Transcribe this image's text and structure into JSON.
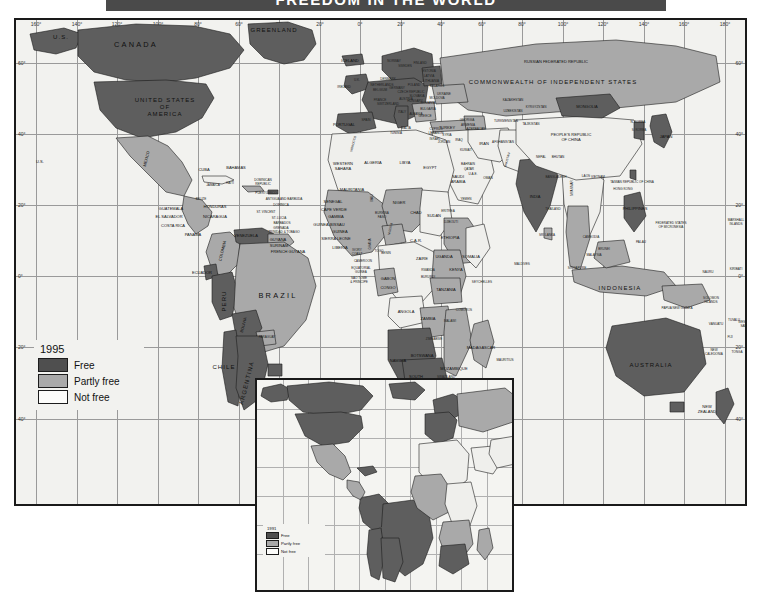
{
  "title": {
    "text": "FREEDOM IN THE WORLD",
    "band_color": "#4a4a4a"
  },
  "legend": {
    "year": "1995",
    "items": [
      {
        "label": "Free",
        "color": "#4f4f4f",
        "key": "free"
      },
      {
        "label": "Partly free",
        "color": "#a9a9a9",
        "key": "partly"
      },
      {
        "label": "Not free",
        "color": "#fcfcfa",
        "key": "notfree"
      }
    ]
  },
  "inset_legend": {
    "year": "1991",
    "items": [
      {
        "label": "Free",
        "color": "#4f4f4f",
        "key": "free"
      },
      {
        "label": "Partly free",
        "color": "#a9a9a9",
        "key": "partly"
      },
      {
        "label": "Not free",
        "color": "#fcfcfa",
        "key": "notfree"
      }
    ]
  },
  "graticule": {
    "longitude_labels": [
      "160°",
      "140°",
      "120°",
      "100°",
      "80°",
      "60°",
      "40°",
      "20°",
      "0°",
      "20°",
      "40°",
      "60°",
      "80°",
      "100°",
      "120°",
      "140°",
      "160°",
      "180°"
    ],
    "latitude_labels_left": [
      "60°",
      "40°",
      "20°",
      "0°",
      "20°",
      "40°"
    ],
    "latitude_labels_right": [
      "60°",
      "40°",
      "20°",
      "0°",
      "20°",
      "40°"
    ]
  },
  "map_labels": {
    "north_america": [
      {
        "t": "U.S.",
        "x": 45,
        "y": 17,
        "c": "md"
      },
      {
        "t": "CANADA",
        "x": 120,
        "y": 25,
        "c": "lg"
      },
      {
        "t": "UNITED STATES\nOF\nAMERICA",
        "x": 149,
        "y": 87,
        "c": "md"
      },
      {
        "t": "U.S.",
        "x": 24,
        "y": 142,
        "c": "sm"
      },
      {
        "t": "GREENLAND",
        "x": 258,
        "y": 10,
        "c": "md"
      },
      {
        "t": "MEXICO",
        "x": 131,
        "y": 139,
        "c": "sm",
        "r": "rot"
      }
    ],
    "central_america_caribbean": [
      {
        "t": "CUBA",
        "x": 188,
        "y": 150,
        "c": "sm"
      },
      {
        "t": "BAHAMAS",
        "x": 220,
        "y": 148,
        "c": "sm"
      },
      {
        "t": "JAMAICA",
        "x": 197,
        "y": 166,
        "c": "xs"
      },
      {
        "t": "HAITI",
        "x": 214,
        "y": 164,
        "c": "xs"
      },
      {
        "t": "DOMINICAN\nREPUBLIC",
        "x": 247,
        "y": 163,
        "c": "xs"
      },
      {
        "t": "PUERTO RICO",
        "x": 250,
        "y": 174,
        "c": "xs"
      },
      {
        "t": "BELIZE",
        "x": 185,
        "y": 180,
        "c": "xs"
      },
      {
        "t": "GUATEMALA",
        "x": 155,
        "y": 189,
        "c": "sm"
      },
      {
        "t": "HONDURAS",
        "x": 199,
        "y": 187,
        "c": "sm"
      },
      {
        "t": "EL SALVADOR",
        "x": 153,
        "y": 197,
        "c": "sm"
      },
      {
        "t": "NICARAGUA",
        "x": 199,
        "y": 197,
        "c": "sm"
      },
      {
        "t": "COSTA RICA",
        "x": 157,
        "y": 206,
        "c": "sm"
      },
      {
        "t": "PANAMA",
        "x": 177,
        "y": 215,
        "c": "sm"
      },
      {
        "t": "ANTIGUA AND BARBUDA",
        "x": 268,
        "y": 180,
        "c": "xs"
      },
      {
        "t": "DOMINICA",
        "x": 265,
        "y": 186,
        "c": "xs"
      },
      {
        "t": "ST. LUCIA",
        "x": 263,
        "y": 199,
        "c": "xs"
      },
      {
        "t": "ST. VINCENT",
        "x": 250,
        "y": 193,
        "c": "xs"
      },
      {
        "t": "BARBADOS",
        "x": 266,
        "y": 204,
        "c": "xs"
      },
      {
        "t": "GRENADA",
        "x": 265,
        "y": 209,
        "c": "xs"
      },
      {
        "t": "TRINIDAD & TOBAGO",
        "x": 268,
        "y": 213,
        "c": "xs"
      }
    ],
    "south_america": [
      {
        "t": "VENEZUELA",
        "x": 230,
        "y": 216,
        "c": "sm"
      },
      {
        "t": "COLOMBIA",
        "x": 207,
        "y": 231,
        "c": "sm",
        "r": "rot"
      },
      {
        "t": "GUYANA",
        "x": 262,
        "y": 220,
        "c": "sm"
      },
      {
        "t": "SURINAM",
        "x": 263,
        "y": 226,
        "c": "sm"
      },
      {
        "t": "FRENCH GUYANA",
        "x": 272,
        "y": 232,
        "c": "sm"
      },
      {
        "t": "ECUADOR",
        "x": 186,
        "y": 253,
        "c": "sm"
      },
      {
        "t": "PERU",
        "x": 208,
        "y": 281,
        "c": "md",
        "r": "rotv"
      },
      {
        "t": "BRAZIL",
        "x": 262,
        "y": 276,
        "c": "lg"
      },
      {
        "t": "BOLIVIA",
        "x": 228,
        "y": 305,
        "c": "sm",
        "r": "rot"
      },
      {
        "t": "CHILE",
        "x": 208,
        "y": 347,
        "c": "md"
      },
      {
        "t": "ARGENTINA",
        "x": 231,
        "y": 363,
        "c": "md",
        "r": "rot"
      },
      {
        "t": "URUGUAY",
        "x": 262,
        "y": 371,
        "c": "sm"
      },
      {
        "t": "PARAGUAY",
        "x": 251,
        "y": 318,
        "c": "xs"
      }
    ],
    "europe": [
      {
        "t": "ICELAND",
        "x": 334,
        "y": 41,
        "c": "sm"
      },
      {
        "t": "IRELAND",
        "x": 328,
        "y": 68,
        "c": "xs"
      },
      {
        "t": "U.K.",
        "x": 341,
        "y": 61,
        "c": "xs"
      },
      {
        "t": "NORWAY",
        "x": 378,
        "y": 42,
        "c": "xs"
      },
      {
        "t": "SWEDEN",
        "x": 389,
        "y": 47,
        "c": "xs"
      },
      {
        "t": "FINLAND",
        "x": 404,
        "y": 44,
        "c": "xs"
      },
      {
        "t": "DENMARK",
        "x": 372,
        "y": 60,
        "c": "xs"
      },
      {
        "t": "ESTONIA",
        "x": 413,
        "y": 52,
        "c": "xs"
      },
      {
        "t": "LATVIA",
        "x": 413,
        "y": 57,
        "c": "xs"
      },
      {
        "t": "LITHUANIA",
        "x": 415,
        "y": 62,
        "c": "xs"
      },
      {
        "t": "BELARUS",
        "x": 421,
        "y": 67,
        "c": "xs"
      },
      {
        "t": "POLAND",
        "x": 398,
        "y": 66,
        "c": "xs"
      },
      {
        "t": "GERMANY",
        "x": 381,
        "y": 69,
        "c": "xs"
      },
      {
        "t": "NETHERLANDS",
        "x": 366,
        "y": 66,
        "c": "xs"
      },
      {
        "t": "BELGIUM",
        "x": 364,
        "y": 71,
        "c": "xs"
      },
      {
        "t": "FRANCE",
        "x": 364,
        "y": 81,
        "c": "xs"
      },
      {
        "t": "SWITZERLAND",
        "x": 372,
        "y": 85,
        "c": "xs"
      },
      {
        "t": "AUSTRIA",
        "x": 390,
        "y": 80,
        "c": "xs"
      },
      {
        "t": "CZECH REPUBLIC",
        "x": 395,
        "y": 73,
        "c": "xs"
      },
      {
        "t": "SLOVAKIA",
        "x": 401,
        "y": 77,
        "c": "xs"
      },
      {
        "t": "HUNGARY",
        "x": 399,
        "y": 82,
        "c": "xs"
      },
      {
        "t": "ROMANIA",
        "x": 412,
        "y": 84,
        "c": "xs"
      },
      {
        "t": "UKRAINE",
        "x": 428,
        "y": 75,
        "c": "xs"
      },
      {
        "t": "MOLDOVA",
        "x": 421,
        "y": 79,
        "c": "xs"
      },
      {
        "t": "BULGARIA",
        "x": 412,
        "y": 90,
        "c": "xs"
      },
      {
        "t": "GREECE",
        "x": 409,
        "y": 97,
        "c": "xs"
      },
      {
        "t": "ALBANIA",
        "x": 400,
        "y": 95,
        "c": "xs"
      },
      {
        "t": "ITALY",
        "x": 386,
        "y": 93,
        "c": "xs"
      },
      {
        "t": "PORTUGAL",
        "x": 328,
        "y": 105,
        "c": "sm"
      },
      {
        "t": "SPAIN",
        "x": 350,
        "y": 101,
        "c": "xs"
      },
      {
        "t": "MALTA",
        "x": 390,
        "y": 109,
        "c": "xs"
      },
      {
        "t": "CYPRUS",
        "x": 420,
        "y": 110,
        "c": "xs"
      }
    ],
    "middle_east": [
      {
        "t": "TURKEY",
        "x": 431,
        "y": 108,
        "c": "sm"
      },
      {
        "t": "GEORGIA",
        "x": 451,
        "y": 101,
        "c": "xs"
      },
      {
        "t": "ARMENIA",
        "x": 452,
        "y": 106,
        "c": "xs"
      },
      {
        "t": "AZERBAIJAN",
        "x": 460,
        "y": 110,
        "c": "xs"
      },
      {
        "t": "SYRIA",
        "x": 431,
        "y": 116,
        "c": "xs"
      },
      {
        "t": "LEBANON",
        "x": 420,
        "y": 114,
        "c": "xs"
      },
      {
        "t": "ISRAEL",
        "x": 419,
        "y": 120,
        "c": "xs"
      },
      {
        "t": "JORDAN",
        "x": 428,
        "y": 123,
        "c": "xs"
      },
      {
        "t": "IRAQ",
        "x": 443,
        "y": 121,
        "c": "xs"
      },
      {
        "t": "IRAN",
        "x": 468,
        "y": 124,
        "c": "sm"
      },
      {
        "t": "KUWAIT",
        "x": 450,
        "y": 131,
        "c": "xs"
      },
      {
        "t": "BAHRAIN",
        "x": 452,
        "y": 145,
        "c": "xs"
      },
      {
        "t": "QATAR",
        "x": 453,
        "y": 150,
        "c": "xs"
      },
      {
        "t": "U.A.E.",
        "x": 457,
        "y": 155,
        "c": "xs"
      },
      {
        "t": "SAUDI\nARABIA",
        "x": 442,
        "y": 160,
        "c": "sm"
      },
      {
        "t": "OMAN",
        "x": 472,
        "y": 159,
        "c": "xs"
      },
      {
        "t": "YEMEN",
        "x": 450,
        "y": 180,
        "c": "xs"
      },
      {
        "t": "AFGHANISTAN",
        "x": 487,
        "y": 123,
        "c": "xs"
      },
      {
        "t": "PAKISTAN",
        "x": 492,
        "y": 140,
        "c": "xs",
        "r": "rot"
      }
    ],
    "africa": [
      {
        "t": "MOROCCO",
        "x": 338,
        "y": 124,
        "c": "xs",
        "r": "rot"
      },
      {
        "t": "ALGERIA",
        "x": 357,
        "y": 143,
        "c": "sm"
      },
      {
        "t": "TUNISIA",
        "x": 380,
        "y": 114,
        "c": "xs"
      },
      {
        "t": "LIBYA",
        "x": 389,
        "y": 143,
        "c": "sm"
      },
      {
        "t": "EGYPT",
        "x": 414,
        "y": 148,
        "c": "sm"
      },
      {
        "t": "WESTERN\nSAHARA",
        "x": 327,
        "y": 147,
        "c": "sm"
      },
      {
        "t": "MAURITANIA",
        "x": 336,
        "y": 170,
        "c": "sm"
      },
      {
        "t": "SENEGAL",
        "x": 317,
        "y": 182,
        "c": "sm"
      },
      {
        "t": "CAPE VERDE",
        "x": 318,
        "y": 190,
        "c": "sm"
      },
      {
        "t": "GAMBIA",
        "x": 320,
        "y": 197,
        "c": "sm"
      },
      {
        "t": "GUINEA-BISSAU",
        "x": 313,
        "y": 205,
        "c": "sm"
      },
      {
        "t": "GUINEA",
        "x": 324,
        "y": 212,
        "c": "sm"
      },
      {
        "t": "SIERRA LEONE",
        "x": 320,
        "y": 219,
        "c": "sm"
      },
      {
        "t": "LIBERIA",
        "x": 324,
        "y": 228,
        "c": "sm"
      },
      {
        "t": "MALI",
        "x": 357,
        "y": 178,
        "c": "xs",
        "r": "rotv"
      },
      {
        "t": "BURKINA\nFASO",
        "x": 366,
        "y": 196,
        "c": "xs"
      },
      {
        "t": "NIGER",
        "x": 383,
        "y": 183,
        "c": "sm"
      },
      {
        "t": "CHAD",
        "x": 400,
        "y": 193,
        "c": "sm"
      },
      {
        "t": "SUDAN",
        "x": 418,
        "y": 196,
        "c": "sm"
      },
      {
        "t": "NIGERIA",
        "x": 375,
        "y": 209,
        "c": "xs",
        "r": "rot"
      },
      {
        "t": "IVORY\nCOAST",
        "x": 341,
        "y": 233,
        "c": "xs"
      },
      {
        "t": "GHANA",
        "x": 355,
        "y": 224,
        "c": "xs",
        "r": "rotv"
      },
      {
        "t": "TOGO",
        "x": 363,
        "y": 232,
        "c": "xs"
      },
      {
        "t": "BENIN",
        "x": 370,
        "y": 234,
        "c": "xs"
      },
      {
        "t": "CAMEROON",
        "x": 347,
        "y": 242,
        "c": "xs"
      },
      {
        "t": "EQUATORIAL\nGUINEA",
        "x": 345,
        "y": 251,
        "c": "xs"
      },
      {
        "t": "SAO TOME\n& PRINCIPE",
        "x": 343,
        "y": 261,
        "c": "xs"
      },
      {
        "t": "GABON",
        "x": 372,
        "y": 259,
        "c": "sm"
      },
      {
        "t": "CONGO",
        "x": 372,
        "y": 268,
        "c": "sm"
      },
      {
        "t": "C.A.R.",
        "x": 400,
        "y": 221,
        "c": "sm"
      },
      {
        "t": "ETHIOPIA",
        "x": 434,
        "y": 218,
        "c": "sm"
      },
      {
        "t": "DJIBOUTI",
        "x": 435,
        "y": 203,
        "c": "xs"
      },
      {
        "t": "SOMALIA",
        "x": 455,
        "y": 237,
        "c": "sm"
      },
      {
        "t": "ZAIRE",
        "x": 406,
        "y": 239,
        "c": "sm"
      },
      {
        "t": "UGANDA",
        "x": 428,
        "y": 237,
        "c": "sm"
      },
      {
        "t": "KENYA",
        "x": 440,
        "y": 250,
        "c": "sm"
      },
      {
        "t": "RWANDA",
        "x": 412,
        "y": 251,
        "c": "xs"
      },
      {
        "t": "BURUNDI",
        "x": 412,
        "y": 258,
        "c": "xs"
      },
      {
        "t": "TANZANIA",
        "x": 430,
        "y": 270,
        "c": "sm"
      },
      {
        "t": "ANGOLA",
        "x": 390,
        "y": 292,
        "c": "sm"
      },
      {
        "t": "ZAMBIA",
        "x": 412,
        "y": 299,
        "c": "sm"
      },
      {
        "t": "MALAWI",
        "x": 434,
        "y": 302,
        "c": "xs"
      },
      {
        "t": "COMOROS",
        "x": 448,
        "y": 291,
        "c": "xs"
      },
      {
        "t": "ZIMBABWE",
        "x": 418,
        "y": 320,
        "c": "xs"
      },
      {
        "t": "BOTSWANA",
        "x": 406,
        "y": 336,
        "c": "sm"
      },
      {
        "t": "NAMIBIA",
        "x": 382,
        "y": 341,
        "c": "sm"
      },
      {
        "t": "SOUTH\nAFRICA",
        "x": 400,
        "y": 360,
        "c": "sm"
      },
      {
        "t": "MOZAMBIQUE",
        "x": 438,
        "y": 349,
        "c": "sm"
      },
      {
        "t": "SWAZILAND",
        "x": 430,
        "y": 358,
        "c": "xs"
      },
      {
        "t": "LESOTHO",
        "x": 424,
        "y": 368,
        "c": "xs"
      },
      {
        "t": "MADAGASCAR",
        "x": 465,
        "y": 328,
        "c": "sm"
      },
      {
        "t": "MAURITIUS",
        "x": 489,
        "y": 341,
        "c": "xs"
      },
      {
        "t": "SEYCHELLES",
        "x": 466,
        "y": 263,
        "c": "xs"
      },
      {
        "t": "MALDIVES",
        "x": 506,
        "y": 245,
        "c": "xs"
      },
      {
        "t": "ERITREA",
        "x": 432,
        "y": 192,
        "c": "xs"
      }
    ],
    "asia": [
      {
        "t": "RUSSIAN FEDERATED REPUBLIC",
        "x": 540,
        "y": 42,
        "c": "sm"
      },
      {
        "t": "COMMONWEALTH OF INDEPENDENT STATES",
        "x": 537,
        "y": 62,
        "c": "md"
      },
      {
        "t": "KAZAKHSTAN",
        "x": 497,
        "y": 81,
        "c": "xs"
      },
      {
        "t": "UZBEKISTAN",
        "x": 497,
        "y": 92,
        "c": "xs"
      },
      {
        "t": "KYRGYZSTAN",
        "x": 520,
        "y": 88,
        "c": "xs"
      },
      {
        "t": "TURKMENISTAN",
        "x": 490,
        "y": 102,
        "c": "xs"
      },
      {
        "t": "TAJIKISTAN",
        "x": 515,
        "y": 105,
        "c": "xs"
      },
      {
        "t": "MONGOLIA",
        "x": 571,
        "y": 87,
        "c": "sm"
      },
      {
        "t": "PEOPLE'S REPUBLIC\nOF CHINA",
        "x": 555,
        "y": 118,
        "c": "sm"
      },
      {
        "t": "N. KOREA",
        "x": 622,
        "y": 103,
        "c": "xs"
      },
      {
        "t": "S. KOREA",
        "x": 623,
        "y": 111,
        "c": "xs"
      },
      {
        "t": "JAPAN",
        "x": 650,
        "y": 117,
        "c": "sm"
      },
      {
        "t": "NEPAL",
        "x": 525,
        "y": 138,
        "c": "xs"
      },
      {
        "t": "BHUTAN",
        "x": 542,
        "y": 138,
        "c": "xs"
      },
      {
        "t": "BANGLADESH",
        "x": 540,
        "y": 158,
        "c": "xs"
      },
      {
        "t": "INDIA",
        "x": 519,
        "y": 177,
        "c": "sm"
      },
      {
        "t": "SRI LANKA",
        "x": 531,
        "y": 216,
        "c": "xs"
      },
      {
        "t": "MYANMAR",
        "x": 557,
        "y": 168,
        "c": "xs",
        "r": "rotv"
      },
      {
        "t": "THAILAND",
        "x": 537,
        "y": 190,
        "c": "xs"
      },
      {
        "t": "LAOS",
        "x": 570,
        "y": 157,
        "c": "xs"
      },
      {
        "t": "VIETNAM",
        "x": 582,
        "y": 158,
        "c": "xs"
      },
      {
        "t": "CAMBODIA",
        "x": 575,
        "y": 218,
        "c": "xs"
      },
      {
        "t": "TAIWAN REPUBLIC OF CHINA",
        "x": 616,
        "y": 163,
        "c": "xs"
      },
      {
        "t": "HONG KONG",
        "x": 607,
        "y": 170,
        "c": "xs"
      },
      {
        "t": "PHILIPPINES",
        "x": 619,
        "y": 189,
        "c": "sm"
      },
      {
        "t": "BRUNEI",
        "x": 588,
        "y": 230,
        "c": "xs"
      },
      {
        "t": "MALAYSIA",
        "x": 578,
        "y": 236,
        "c": "xs"
      },
      {
        "t": "SINGAPORE",
        "x": 561,
        "y": 249,
        "c": "xs"
      },
      {
        "t": "INDONESIA",
        "x": 604,
        "y": 268,
        "c": "md"
      }
    ],
    "oceania": [
      {
        "t": "AUSTRALIA",
        "x": 635,
        "y": 345,
        "c": "md"
      },
      {
        "t": "NEW\nZEALAND",
        "x": 691,
        "y": 390,
        "c": "sm"
      },
      {
        "t": "PAPUA NEW GUINEA",
        "x": 661,
        "y": 289,
        "c": "xs"
      },
      {
        "t": "SOLOMON\nISLANDS",
        "x": 695,
        "y": 281,
        "c": "xs"
      },
      {
        "t": "VANUATU",
        "x": 700,
        "y": 305,
        "c": "xs"
      },
      {
        "t": "FIJI",
        "x": 714,
        "y": 318,
        "c": "xs"
      },
      {
        "t": "NEW\nCALEDONIA",
        "x": 698,
        "y": 333,
        "c": "xs"
      },
      {
        "t": "TONGA",
        "x": 721,
        "y": 333,
        "c": "xs"
      },
      {
        "t": "TUVALU",
        "x": 718,
        "y": 301,
        "c": "xs"
      },
      {
        "t": "WESTERN\nSAMOA",
        "x": 730,
        "y": 305,
        "c": "xs"
      },
      {
        "t": "NAURU",
        "x": 692,
        "y": 253,
        "c": "xs"
      },
      {
        "t": "KIRIBATI",
        "x": 720,
        "y": 250,
        "c": "xs"
      },
      {
        "t": "MARSHALL\nISLANDS",
        "x": 720,
        "y": 203,
        "c": "xs"
      },
      {
        "t": "FEDERATED STATES\nOF MICRONESIA",
        "x": 655,
        "y": 206,
        "c": "xs"
      },
      {
        "t": "PALAU",
        "x": 625,
        "y": 223,
        "c": "xs"
      }
    ]
  }
}
